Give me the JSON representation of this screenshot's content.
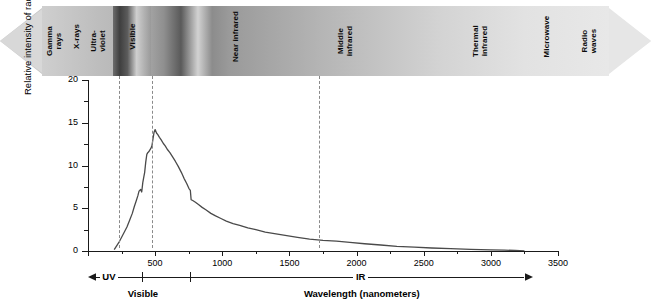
{
  "spectrum": {
    "name": "electromagnetic-spectrum-bar",
    "direction": "double-arrow",
    "bands": [
      {
        "label": "Gamma\nrays"
      },
      {
        "label": "X-rays"
      },
      {
        "label": "Ultra-\nviolet"
      },
      {
        "label": "Visible"
      },
      {
        "label": "Near infrared"
      },
      {
        "label": "Middle\ninfrared"
      },
      {
        "label": "Thermal\ninfrared"
      },
      {
        "label": "Microwave"
      },
      {
        "label": "Radio\nwaves"
      }
    ]
  },
  "axes": {
    "y_title": "Relative intensity of radiation",
    "x_title": "Wavelength (nanometers)",
    "y_ticks": [
      "0",
      "5",
      "10",
      "15",
      "20"
    ],
    "x_ticks": [
      "500",
      "1000",
      "1500",
      "2000",
      "2500",
      "3000",
      "3500"
    ]
  },
  "regions": {
    "uv": "UV",
    "visible": "Visible",
    "ir": "IR"
  },
  "chart_data": {
    "type": "line",
    "title": "",
    "xlabel": "Wavelength (nanometers)",
    "ylabel": "Relative intensity of radiation",
    "xlim": [
      0,
      3500
    ],
    "ylim": [
      0,
      20
    ],
    "xticks": [
      0,
      500,
      1000,
      1500,
      2000,
      2500,
      3000,
      3500
    ],
    "yticks": [
      0,
      5,
      10,
      15,
      20
    ],
    "grid": false,
    "legend": null,
    "annotations": [
      {
        "text": "UV",
        "x_range": [
          0,
          400
        ]
      },
      {
        "text": "Visible",
        "x_range": [
          400,
          760
        ]
      },
      {
        "text": "IR",
        "x_range": [
          760,
          3500
        ]
      }
    ],
    "guide_lines_x": [
      400,
      760,
      3000
    ],
    "series": [
      {
        "name": "Solar radiation intensity",
        "x": [
          195,
          230,
          260,
          290,
          310,
          330,
          345,
          360,
          372,
          380,
          392,
          400,
          408,
          415,
          422,
          430,
          438,
          445,
          452,
          460,
          468,
          476,
          484,
          492,
          500,
          510,
          520,
          532,
          545,
          560,
          575,
          590,
          610,
          630,
          650,
          672,
          695,
          715,
          735,
          752,
          762,
          768,
          780,
          800,
          825,
          850,
          880,
          915,
          950,
          990,
          1030,
          1080,
          1130,
          1190,
          1250,
          1320,
          1400,
          1480,
          1560,
          1650,
          1750,
          1850,
          1950,
          2060,
          2180,
          2300,
          2430,
          2560,
          2700,
          2850,
          3000,
          3100,
          3180,
          3250
        ],
        "y": [
          0.15,
          1.0,
          1.9,
          2.8,
          3.6,
          4.4,
          5.2,
          5.9,
          6.5,
          7.0,
          7.2,
          6.9,
          8.0,
          8.6,
          9.2,
          10.4,
          11.3,
          11.5,
          11.6,
          11.8,
          12.0,
          12.3,
          13.1,
          13.9,
          14.2,
          13.8,
          13.6,
          13.3,
          13.0,
          12.6,
          12.3,
          11.9,
          11.5,
          11.0,
          10.5,
          9.9,
          9.2,
          8.5,
          7.9,
          7.3,
          7.1,
          6.0,
          5.9,
          5.7,
          5.4,
          5.1,
          4.8,
          4.4,
          4.1,
          3.8,
          3.5,
          3.2,
          3.0,
          2.7,
          2.5,
          2.2,
          2.0,
          1.8,
          1.6,
          1.4,
          1.25,
          1.15,
          1.0,
          0.85,
          0.7,
          0.55,
          0.45,
          0.35,
          0.28,
          0.2,
          0.14,
          0.1,
          0.06,
          0.0
        ]
      }
    ]
  }
}
